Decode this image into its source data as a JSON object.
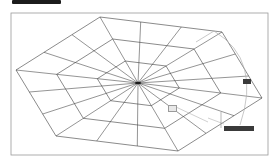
{
  "header": {
    "badge_label": "",
    "text": ""
  },
  "drawing": {
    "frame": {
      "x1": 11,
      "y1": 13,
      "x2": 268,
      "y2": 155,
      "color": "#9a9a9a"
    },
    "center": {
      "x": 138,
      "y": 83
    },
    "outer_vertices": [
      [
        100,
        17
      ],
      [
        222,
        32
      ],
      [
        262,
        98
      ],
      [
        178,
        151
      ],
      [
        56,
        136
      ],
      [
        16,
        70
      ]
    ],
    "rings": 3,
    "spokes_per_edge": 3,
    "line_color": "#3c3c3c",
    "construction_color": "#b0b0b0"
  },
  "tooltips": {
    "angle_input": {
      "label": "",
      "x": 243,
      "y": 79,
      "w": 8,
      "h": 5
    },
    "length_label": {
      "label": "",
      "x": 168,
      "y": 105,
      "w": 7,
      "h": 5
    },
    "dynamic_input": {
      "label": "",
      "x": 224,
      "y": 126,
      "w": 30,
      "h": 5
    }
  }
}
